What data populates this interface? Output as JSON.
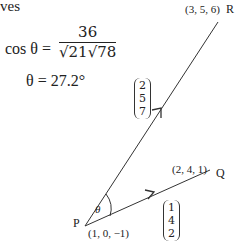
{
  "text": {
    "intro_fragment": "ves",
    "cos_lhs": "cos θ =",
    "cos_numerator": "36",
    "cos_denominator": "√21√78",
    "theta_result": "θ = 27.2°"
  },
  "points": {
    "P": {
      "label": "P",
      "coords": "(1, 0, −1)"
    },
    "Q": {
      "label": "Q",
      "coords": "(2, 4, 1)"
    },
    "R": {
      "label": "R",
      "coords": "(3, 5, 6)"
    }
  },
  "vectors": {
    "PR": [
      "2",
      "5",
      "7"
    ],
    "PQ": [
      "1",
      "4",
      "2"
    ]
  },
  "angle_label": "θ",
  "colors": {
    "line": "#333333",
    "text": "#222222",
    "background": "#ffffff"
  }
}
